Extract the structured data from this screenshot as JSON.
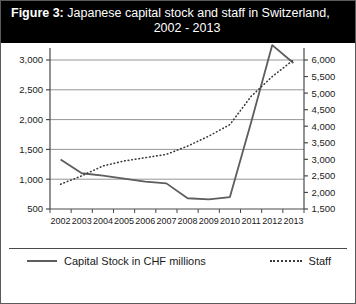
{
  "title": {
    "figure_label": "Figure 3:",
    "line1_rest": " Japanese capital stock and staff in Switzerland,",
    "line2": "2002 - 2013"
  },
  "legend": {
    "series1_label": "Capital Stock in CHF millions",
    "series2_label": "Staff",
    "position": "bottom"
  },
  "colors": {
    "title_bg": "#000000",
    "title_fg": "#ffffff",
    "capital_stock_line": "#5d5d5d",
    "staff_line": "#3a3a3a",
    "grid": "#8a8a8a",
    "axis": "#4a4a4a",
    "tick_text": "#1a1a1a",
    "frame": "#5a5a5a"
  },
  "chart_data": {
    "type": "line",
    "title": "Figure 3: Japanese capital stock and staff in Switzerland, 2002 - 2013",
    "xlabel": "",
    "ylabel": "",
    "grid": true,
    "categories": [
      "2002",
      "2003",
      "2004",
      "2005",
      "2006",
      "2007",
      "2008",
      "2009",
      "2010",
      "2011",
      "2012",
      "2013"
    ],
    "left_axis": {
      "label": "Capital Stock in CHF millions",
      "ticks": [
        "500",
        "1,000",
        "1,500",
        "2,000",
        "2,500",
        "3,000"
      ],
      "tick_values": [
        500,
        1000,
        1500,
        2000,
        2500,
        3000
      ],
      "ylim": [
        500,
        3000
      ]
    },
    "right_axis": {
      "label": "Staff",
      "ticks": [
        "1,500",
        "2,000",
        "2,500",
        "3,000",
        "3,500",
        "4,000",
        "4,500",
        "5,000",
        "5,500",
        "6,000"
      ],
      "tick_values": [
        1500,
        2000,
        2500,
        3000,
        3500,
        4000,
        4500,
        5000,
        5500,
        6000
      ],
      "ylim": [
        1500,
        6000
      ]
    },
    "series": [
      {
        "name": "Capital Stock in CHF millions",
        "axis": "left",
        "style": "solid",
        "values": [
          1330,
          1100,
          1060,
          1010,
          960,
          930,
          680,
          660,
          700,
          1950,
          3250,
          2950
        ]
      },
      {
        "name": "Staff",
        "axis": "right",
        "style": "dotted",
        "values": [
          2250,
          2500,
          2800,
          2950,
          3050,
          3150,
          3400,
          3700,
          4050,
          4900,
          5500,
          6000
        ]
      }
    ]
  }
}
